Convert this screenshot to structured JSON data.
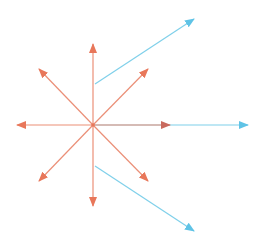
{
  "diagram": {
    "title": "",
    "colors": {
      "red": "#e8775a",
      "blue": "#6ccbe8",
      "background": "#ffffff"
    },
    "red_vectors": [
      {
        "name": "red-arrow-up",
        "direction": "up"
      },
      {
        "name": "red-arrow-up-right",
        "direction": "up-right"
      },
      {
        "name": "red-arrow-right",
        "direction": "right"
      },
      {
        "name": "red-arrow-down-right",
        "direction": "down-right"
      },
      {
        "name": "red-arrow-down",
        "direction": "down"
      },
      {
        "name": "red-arrow-down-left",
        "direction": "down-left"
      },
      {
        "name": "red-arrow-left",
        "direction": "left"
      },
      {
        "name": "red-arrow-up-left",
        "direction": "up-left"
      }
    ],
    "blue_vectors": [
      {
        "name": "blue-arrow-upper",
        "direction": "up-right"
      },
      {
        "name": "blue-arrow-right",
        "direction": "right"
      },
      {
        "name": "blue-arrow-lower",
        "direction": "down-right"
      }
    ]
  }
}
